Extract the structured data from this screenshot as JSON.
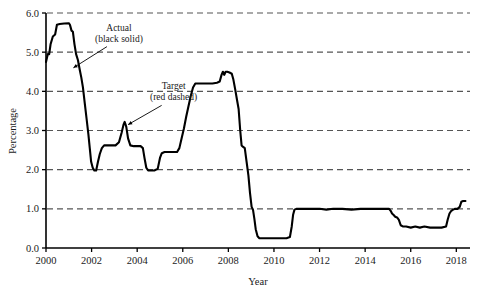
{
  "chart_data": {
    "type": "line",
    "title": "",
    "xlabel": "Year",
    "ylabel": "Percentage",
    "xlim": [
      2000,
      2018.6
    ],
    "ylim": [
      0.0,
      6.0
    ],
    "grid": true,
    "grid_style": "dashed-horizontal",
    "legend_position": "inline-annotations",
    "xticks": [
      2000,
      2002,
      2004,
      2006,
      2008,
      2010,
      2012,
      2014,
      2016,
      2018
    ],
    "xticklabels": [
      "2000",
      "2002",
      "2004",
      "2006",
      "2008",
      "2010",
      "2012",
      "2014",
      "2016",
      "2018"
    ],
    "yticks": [
      0.0,
      1.0,
      2.0,
      3.0,
      4.0,
      5.0,
      6.0
    ],
    "yticklabels": [
      "0.0",
      "1.0",
      "2.0",
      "3.0",
      "4.0",
      "5.0",
      "6.0"
    ],
    "annotations": [
      {
        "name": "actual-annotation",
        "line1": "Actual",
        "line2": "(black solid)",
        "x": 2003.2,
        "y": 5.55,
        "arrow_to_x": 2001.2,
        "arrow_to_y": 4.6
      },
      {
        "name": "target-annotation",
        "line1": "Target",
        "line2": "(red dashed)",
        "x": 2005.6,
        "y": 4.05,
        "arrow_to_x": 2003.6,
        "arrow_to_y": 3.15
      }
    ],
    "series": [
      {
        "name": "Actual",
        "style": "black solid",
        "color": "#000000",
        "points": [
          [
            2000.0,
            4.75
          ],
          [
            2000.08,
            4.95
          ],
          [
            2000.14,
            4.95
          ],
          [
            2000.2,
            5.2
          ],
          [
            2000.3,
            5.4
          ],
          [
            2000.4,
            5.45
          ],
          [
            2000.48,
            5.7
          ],
          [
            2000.6,
            5.72
          ],
          [
            2000.8,
            5.73
          ],
          [
            2001.0,
            5.74
          ],
          [
            2001.05,
            5.7
          ],
          [
            2001.12,
            5.55
          ],
          [
            2001.18,
            5.52
          ],
          [
            2001.25,
            5.2
          ],
          [
            2001.32,
            4.95
          ],
          [
            2001.4,
            4.8
          ],
          [
            2001.48,
            4.55
          ],
          [
            2001.55,
            4.35
          ],
          [
            2001.62,
            4.1
          ],
          [
            2001.7,
            3.7
          ],
          [
            2001.78,
            3.3
          ],
          [
            2001.86,
            2.9
          ],
          [
            2001.92,
            2.55
          ],
          [
            2001.98,
            2.2
          ],
          [
            2002.05,
            2.05
          ],
          [
            2002.12,
            1.98
          ],
          [
            2002.2,
            1.98
          ],
          [
            2002.28,
            2.2
          ],
          [
            2002.36,
            2.4
          ],
          [
            2002.45,
            2.55
          ],
          [
            2002.55,
            2.62
          ],
          [
            2002.7,
            2.62
          ],
          [
            2002.9,
            2.62
          ],
          [
            2003.05,
            2.62
          ],
          [
            2003.2,
            2.7
          ],
          [
            2003.32,
            2.95
          ],
          [
            2003.4,
            3.15
          ],
          [
            2003.45,
            3.22
          ],
          [
            2003.52,
            3.1
          ],
          [
            2003.6,
            2.8
          ],
          [
            2003.7,
            2.62
          ],
          [
            2003.85,
            2.6
          ],
          [
            2004.0,
            2.6
          ],
          [
            2004.15,
            2.6
          ],
          [
            2004.25,
            2.55
          ],
          [
            2004.32,
            2.3
          ],
          [
            2004.4,
            2.05
          ],
          [
            2004.48,
            1.98
          ],
          [
            2004.6,
            1.98
          ],
          [
            2004.75,
            1.98
          ],
          [
            2004.9,
            2.02
          ],
          [
            2005.0,
            2.3
          ],
          [
            2005.08,
            2.42
          ],
          [
            2005.2,
            2.45
          ],
          [
            2005.4,
            2.45
          ],
          [
            2005.6,
            2.45
          ],
          [
            2005.75,
            2.45
          ],
          [
            2005.85,
            2.55
          ],
          [
            2005.95,
            2.8
          ],
          [
            2006.05,
            3.05
          ],
          [
            2006.15,
            3.35
          ],
          [
            2006.25,
            3.62
          ],
          [
            2006.35,
            3.88
          ],
          [
            2006.45,
            4.1
          ],
          [
            2006.55,
            4.2
          ],
          [
            2006.7,
            4.2
          ],
          [
            2006.9,
            4.2
          ],
          [
            2007.1,
            4.2
          ],
          [
            2007.3,
            4.2
          ],
          [
            2007.5,
            4.22
          ],
          [
            2007.62,
            4.25
          ],
          [
            2007.7,
            4.42
          ],
          [
            2007.76,
            4.5
          ],
          [
            2007.82,
            4.42
          ],
          [
            2007.88,
            4.5
          ],
          [
            2007.95,
            4.5
          ],
          [
            2008.05,
            4.48
          ],
          [
            2008.15,
            4.45
          ],
          [
            2008.22,
            4.3
          ],
          [
            2008.3,
            4.05
          ],
          [
            2008.38,
            3.78
          ],
          [
            2008.45,
            3.55
          ],
          [
            2008.52,
            3.0
          ],
          [
            2008.58,
            2.62
          ],
          [
            2008.65,
            2.58
          ],
          [
            2008.72,
            2.55
          ],
          [
            2008.8,
            2.2
          ],
          [
            2008.88,
            1.85
          ],
          [
            2008.95,
            1.4
          ],
          [
            2009.02,
            1.05
          ],
          [
            2009.08,
            0.98
          ],
          [
            2009.14,
            0.75
          ],
          [
            2009.2,
            0.48
          ],
          [
            2009.28,
            0.3
          ],
          [
            2009.36,
            0.25
          ],
          [
            2009.5,
            0.25
          ],
          [
            2009.7,
            0.25
          ],
          [
            2010.0,
            0.25
          ],
          [
            2010.3,
            0.25
          ],
          [
            2010.55,
            0.25
          ],
          [
            2010.7,
            0.28
          ],
          [
            2010.78,
            0.55
          ],
          [
            2010.84,
            0.85
          ],
          [
            2010.9,
            0.98
          ],
          [
            2011.0,
            1.0
          ],
          [
            2011.3,
            1.0
          ],
          [
            2011.7,
            1.0
          ],
          [
            2012.0,
            1.0
          ],
          [
            2012.3,
            0.98
          ],
          [
            2012.6,
            1.0
          ],
          [
            2013.0,
            1.0
          ],
          [
            2013.4,
            0.98
          ],
          [
            2013.8,
            1.0
          ],
          [
            2014.2,
            1.0
          ],
          [
            2014.6,
            1.0
          ],
          [
            2014.9,
            1.0
          ],
          [
            2015.05,
            1.0
          ],
          [
            2015.12,
            0.95
          ],
          [
            2015.18,
            0.88
          ],
          [
            2015.24,
            0.85
          ],
          [
            2015.32,
            0.8
          ],
          [
            2015.4,
            0.78
          ],
          [
            2015.48,
            0.72
          ],
          [
            2015.56,
            0.58
          ],
          [
            2015.65,
            0.55
          ],
          [
            2015.8,
            0.55
          ],
          [
            2016.0,
            0.52
          ],
          [
            2016.2,
            0.55
          ],
          [
            2016.4,
            0.52
          ],
          [
            2016.6,
            0.55
          ],
          [
            2016.85,
            0.52
          ],
          [
            2017.1,
            0.52
          ],
          [
            2017.35,
            0.52
          ],
          [
            2017.55,
            0.55
          ],
          [
            2017.62,
            0.72
          ],
          [
            2017.7,
            0.88
          ],
          [
            2017.78,
            0.95
          ],
          [
            2017.86,
            0.98
          ],
          [
            2017.95,
            1.0
          ],
          [
            2018.05,
            1.0
          ],
          [
            2018.15,
            1.05
          ],
          [
            2018.22,
            1.18
          ],
          [
            2018.3,
            1.2
          ],
          [
            2018.4,
            1.2
          ]
        ]
      }
    ]
  },
  "figure": {
    "axis_color": "#000000",
    "grid_color": "#555555",
    "line_color": "#000000",
    "background": "#ffffff"
  }
}
